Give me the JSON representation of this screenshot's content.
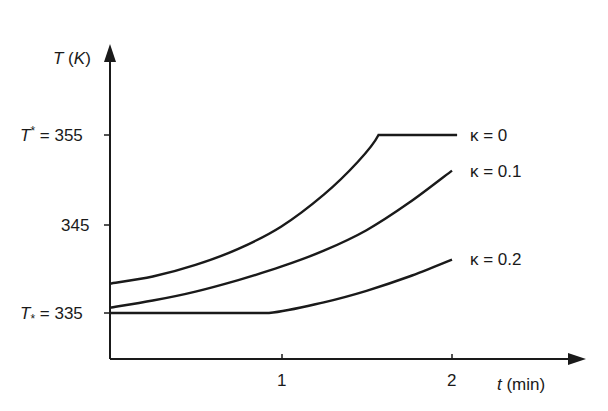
{
  "chart_data": {
    "type": "line",
    "title": "",
    "xlabel": "t (min)",
    "ylabel": "T (K)",
    "xlim": [
      0,
      2.6
    ],
    "ylim": [
      331,
      362
    ],
    "grid": false,
    "legend_position": "inline-right",
    "x_ticks": [
      {
        "value": 1,
        "label": "1"
      },
      {
        "value": 2,
        "label": "2"
      }
    ],
    "y_ticks": [
      {
        "value": 355,
        "label": "T* = 355"
      },
      {
        "value": 345,
        "label": "345"
      },
      {
        "value": 335,
        "label": "T* = 335"
      }
    ],
    "series": [
      {
        "name": "κ = 0",
        "x": [
          0,
          0.25,
          0.5,
          0.75,
          1.0,
          1.25,
          1.45,
          1.57,
          2.03
        ],
        "y": [
          338.3,
          339.1,
          340.4,
          342.2,
          344.7,
          348.3,
          352.0,
          355,
          355
        ]
      },
      {
        "name": "κ = 0.1",
        "x": [
          0,
          0.25,
          0.5,
          0.75,
          1.0,
          1.25,
          1.5,
          1.75,
          2.0
        ],
        "y": [
          335.6,
          336.4,
          337.4,
          338.7,
          340.2,
          342.0,
          344.3,
          347.4,
          351.0
        ]
      },
      {
        "name": "κ = 0.2",
        "x": [
          0,
          0.5,
          0.93,
          1.25,
          1.5,
          1.75,
          2.0
        ],
        "y": [
          335,
          335,
          335,
          336.2,
          337.5,
          339.1,
          341.0
        ]
      }
    ],
    "annotations": [
      {
        "text": "T* = 355",
        "meaning": "upper bound T superscript star"
      },
      {
        "text": "T* = 335",
        "meaning": "lower bound T subscript star"
      }
    ]
  },
  "labels": {
    "y_axis_title": "T (K)",
    "x_axis_title": "t (min)",
    "y_tick_355_T": "T",
    "y_tick_355_mark": "*",
    "y_tick_355_rest": " = 355",
    "y_tick_345": "345",
    "y_tick_335_T": "T",
    "y_tick_335_mark": "*",
    "y_tick_335_rest": " = 335",
    "x_tick_1": "1",
    "x_tick_2": "2",
    "legend_k0": "κ = 0",
    "legend_k01": "κ = 0.1",
    "legend_k02": "κ = 0.2"
  }
}
